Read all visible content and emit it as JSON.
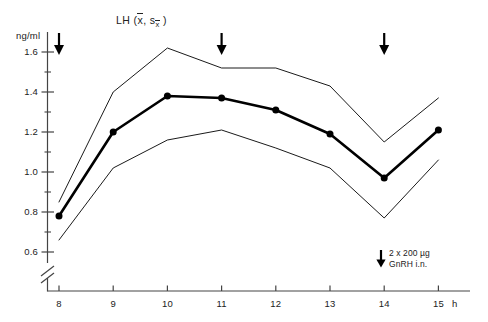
{
  "chart_data": {
    "type": "line",
    "title_parts": {
      "label": "LH",
      "open": "(",
      "mean_symbol": "x",
      "sep": ",",
      "se_symbol": "s",
      "se_sub": "x",
      "close": ")"
    },
    "xlabel": "",
    "ylabel": "ng/ml",
    "x_unit": "h",
    "x": [
      8,
      9,
      10,
      11,
      12,
      13,
      14,
      15
    ],
    "xtick_labels": [
      "8",
      "9",
      "10",
      "11",
      "12",
      "13",
      "14",
      "15"
    ],
    "ytick_labels": [
      "1.6",
      "1.4",
      "1.2",
      "1.0",
      "0.8",
      "0.6"
    ],
    "ytick_values": [
      1.6,
      1.4,
      1.2,
      1.0,
      0.8,
      0.6
    ],
    "yminor_values": [
      1.7,
      1.5,
      1.3,
      1.1,
      0.9,
      0.7,
      0.5
    ],
    "ylim": [
      0.45,
      1.72
    ],
    "xlim": [
      7.62,
      15.55
    ],
    "axis_break": true,
    "grid": false,
    "legend_position": "inside-bottom-right",
    "series": [
      {
        "name": "mean",
        "role": "mean",
        "markers": true,
        "width": 2.6,
        "color": "#000000",
        "values": [
          0.78,
          1.2,
          1.38,
          1.37,
          1.31,
          1.19,
          0.97,
          1.21
        ]
      },
      {
        "name": "mean + s x̄",
        "role": "upper",
        "markers": false,
        "width": 0.9,
        "color": "#000000",
        "values": [
          0.85,
          1.4,
          1.62,
          1.52,
          1.52,
          1.43,
          1.15,
          1.37
        ]
      },
      {
        "name": "mean - s x̄",
        "role": "lower",
        "markers": false,
        "width": 0.9,
        "color": "#000000",
        "values": [
          0.66,
          1.02,
          1.16,
          1.21,
          1.12,
          1.02,
          0.77,
          1.06
        ]
      }
    ],
    "annotations": {
      "arrows": [
        {
          "x": 8,
          "label": "dose-arrow-1"
        },
        {
          "x": 11,
          "label": "dose-arrow-2"
        },
        {
          "x": 14,
          "label": "dose-arrow-3"
        }
      ],
      "legend": {
        "line1": "2 x 200 µg",
        "line2": "GnRH i.n.",
        "arrow": "down-arrow"
      }
    }
  }
}
